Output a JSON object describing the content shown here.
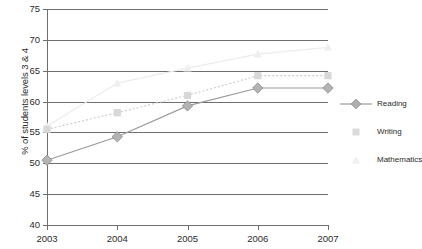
{
  "chart_data": {
    "type": "line",
    "title": "",
    "xlabel": "",
    "ylabel": "% of students levels 3 & 4",
    "categories": [
      "2003",
      "2004",
      "2005",
      "2006",
      "2007"
    ],
    "ylim": [
      40,
      75
    ],
    "yticks": [
      40,
      45,
      50,
      55,
      60,
      65,
      70,
      75
    ],
    "grid": true,
    "legend_position": "right",
    "series": [
      {
        "name": "Reading",
        "values": [
          50.5,
          54.3,
          59.3,
          62.2,
          62.2
        ],
        "color": "#9a9a9a",
        "marker": "diamond",
        "line_style": "solid"
      },
      {
        "name": "Writing",
        "values": [
          55.5,
          58.2,
          61.0,
          64.2,
          64.2
        ],
        "color": "#cfcfcf",
        "marker": "square",
        "line_style": "dotted"
      },
      {
        "name": "Mathematics",
        "values": [
          56.0,
          63.0,
          65.4,
          67.7,
          68.8
        ],
        "color": "#ececec",
        "marker": "triangle",
        "line_style": "solid"
      }
    ]
  },
  "axes": {
    "y_tick_labels": [
      "75",
      "70",
      "65",
      "60",
      "55",
      "50",
      "45",
      "40"
    ],
    "x_tick_labels": [
      "2003",
      "2004",
      "2005",
      "2006",
      "2007"
    ],
    "y_title": "% of students levels 3 & 4"
  },
  "legend": {
    "items": [
      {
        "label": "Reading"
      },
      {
        "label": "Writing"
      },
      {
        "label": "Mathematics"
      }
    ]
  }
}
